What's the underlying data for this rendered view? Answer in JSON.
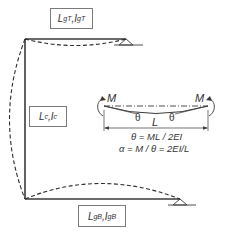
{
  "diagram": {
    "type": "frame-deflection-schematic",
    "labels": {
      "top_girder": {
        "L": "L",
        "L_sub": "gT",
        "sep": ",",
        "I": "I",
        "I_sub": "gT"
      },
      "column": {
        "L": "L",
        "L_sub": "c",
        "sep": ",",
        "I": "I",
        "I_sub": "c"
      },
      "bottom_girder": {
        "L": "L",
        "L_sub": "gB",
        "sep": ",",
        "I": "I",
        "I_sub": "gB"
      }
    },
    "detail": {
      "moment_left": "M",
      "moment_right": "M",
      "theta_left": "θ",
      "theta_right": "θ",
      "span": "L",
      "equation_1": "θ = ML / 2EI",
      "equation_2": "α = M / θ = 2EI/L"
    },
    "colors": {
      "member": "#3a3a3a",
      "deflected": "#2e2e2e",
      "box_border": "#7a7a7a",
      "text": "#333333"
    }
  }
}
